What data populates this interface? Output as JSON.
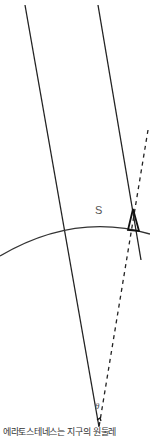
{
  "diagram": {
    "arc_label": "S",
    "angle_label": "θ",
    "caption": "에라토스테네스는 지구의 원둘레",
    "colors": {
      "line": "#222222",
      "text": "#555555",
      "background": "#ffffff"
    }
  }
}
